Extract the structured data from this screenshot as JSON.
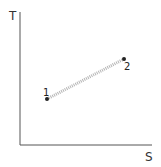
{
  "diagram": {
    "type": "T-S diagram",
    "axes": {
      "y_label": "T",
      "x_label": "S"
    },
    "points": [
      {
        "label": "1",
        "x": 47,
        "y": 99
      },
      {
        "label": "2",
        "x": 124,
        "y": 59
      }
    ],
    "process_line": {
      "from": "1",
      "to": "2",
      "style": "hatched",
      "color": "#b0b0b0"
    }
  }
}
